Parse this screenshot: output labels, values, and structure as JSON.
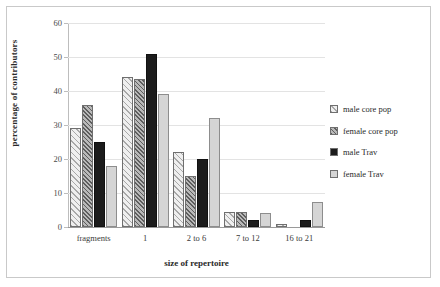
{
  "chart_data": {
    "type": "bar",
    "title": "",
    "xlabel": "size of repertoire",
    "ylabel": "percentage of contributors",
    "categories": [
      "fragments",
      "1",
      "2 to 6",
      "7 to 12",
      "16 to 21"
    ],
    "series": [
      {
        "name": "male core pop",
        "values": [
          29,
          44,
          22,
          4.5,
          1
        ]
      },
      {
        "name": "female core pop",
        "values": [
          36,
          43.5,
          15,
          4.5,
          0
        ]
      },
      {
        "name": "male Trav",
        "values": [
          25,
          51,
          20,
          2,
          2
        ]
      },
      {
        "name": "female Trav",
        "values": [
          18,
          39,
          32,
          4,
          7.5
        ]
      }
    ],
    "ylim": [
      0,
      60
    ],
    "yticks": [
      0,
      10,
      20,
      30,
      40,
      50,
      60
    ],
    "ytick_labels": [
      "0",
      "10",
      "20",
      "30",
      "40",
      "50",
      "60"
    ],
    "grid": true,
    "legend_position": "right",
    "colors": {
      "male core pop": "#efefef",
      "female core pop": "#b9b9b9",
      "male Trav": "#1c1c1c",
      "female Trav": "#d5d5d5",
      "gridline": "#e3e3e3",
      "axis": "#9a9a9a",
      "frame": "#c9c9c9"
    }
  }
}
